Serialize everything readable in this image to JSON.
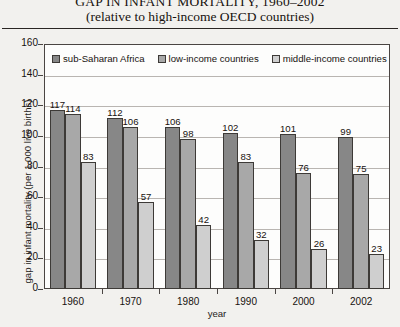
{
  "chart_data": {
    "type": "bar",
    "title": "GAP IN INFANT MORTALITY, 1960–2002",
    "subtitle": "(relative to high-income OECD countries)",
    "xlabel": "year",
    "ylabel": "gap in infant mortality (per 1,000 live births)",
    "categories": [
      "1960",
      "1970",
      "1980",
      "1990",
      "2000",
      "2002"
    ],
    "series": [
      {
        "name": "sub-Saharan Africa",
        "color": "#878787",
        "values": [
          117,
          112,
          106,
          102,
          101,
          99
        ]
      },
      {
        "name": "low-income countries",
        "color": "#a8a8a8",
        "values": [
          114,
          106,
          98,
          83,
          76,
          75
        ]
      },
      {
        "name": "middle-income countries",
        "color": "#cfcfcf",
        "values": [
          83,
          57,
          42,
          32,
          26,
          23
        ]
      }
    ],
    "ylim": [
      0,
      160
    ],
    "yticks": [
      0,
      20,
      40,
      60,
      80,
      100,
      120,
      140,
      160
    ],
    "grid": true,
    "legend_position": "top-left-inside"
  }
}
